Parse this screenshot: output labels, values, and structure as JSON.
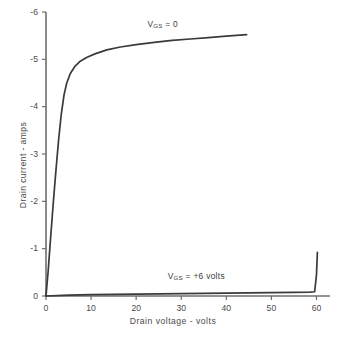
{
  "chart_data": {
    "type": "line",
    "title": "",
    "xlabel": "Drain voltage - volts",
    "ylabel": "Drain current - amps",
    "xlim": [
      0,
      63
    ],
    "ylim": [
      0,
      -6
    ],
    "grid": false,
    "legend_position": "inline-annotation",
    "xticks": [
      "0",
      "10",
      "20",
      "30",
      "40",
      "50",
      "60"
    ],
    "xtick_values": [
      0,
      10,
      20,
      30,
      40,
      50,
      60
    ],
    "yticks": [
      "0",
      "-1",
      "-2",
      "-3",
      "-4",
      "-5",
      "-6"
    ],
    "ytick_values": [
      0,
      -1,
      -2,
      -3,
      -4,
      -5,
      -6
    ],
    "series": [
      {
        "name": "V_GS = 0",
        "annotation": "VGS = 0",
        "x": [
          0,
          0.5,
          1.0,
          1.6,
          2.2,
          2.8,
          3.4,
          4.0,
          4.6,
          5.4,
          6.4,
          7.6,
          9.0,
          11.0,
          13.5,
          16.5,
          20.0,
          24.0,
          28.0,
          32.0,
          36.0,
          40.0,
          44.5
        ],
        "y": [
          0,
          -0.55,
          -1.2,
          -1.95,
          -2.65,
          -3.3,
          -3.85,
          -4.25,
          -4.5,
          -4.7,
          -4.85,
          -4.96,
          -5.04,
          -5.12,
          -5.2,
          -5.26,
          -5.31,
          -5.36,
          -5.4,
          -5.43,
          -5.46,
          -5.49,
          -5.52
        ]
      },
      {
        "name": "V_GS = +6 volts",
        "annotation": "VGS = +6 volts",
        "x": [
          0,
          5,
          10,
          15,
          20,
          25,
          30,
          35,
          40,
          45,
          50,
          55,
          58.5,
          59.6,
          60.0,
          60.2
        ],
        "y": [
          0,
          -0.02,
          -0.03,
          -0.035,
          -0.04,
          -0.045,
          -0.05,
          -0.055,
          -0.06,
          -0.065,
          -0.07,
          -0.075,
          -0.08,
          -0.09,
          -0.45,
          -0.92
        ]
      }
    ],
    "annotations": [
      {
        "text_main": "V",
        "text_sub": "GS",
        "text_tail": " = 0",
        "x": 22.5,
        "y": -5.75
      },
      {
        "text_main": "V",
        "text_sub": "GS",
        "text_tail": " = +6 volts",
        "x": 27.0,
        "y": -0.42
      }
    ]
  },
  "axis": {
    "y_title": "Drain current - amps",
    "x_title": "Drain voltage - volts"
  },
  "caption": {
    "text": ""
  },
  "colors": {
    "curve": "#3a3a3a",
    "axis": "#6f6f6f",
    "text": "#4a4a4a",
    "background": "#ffffff"
  }
}
